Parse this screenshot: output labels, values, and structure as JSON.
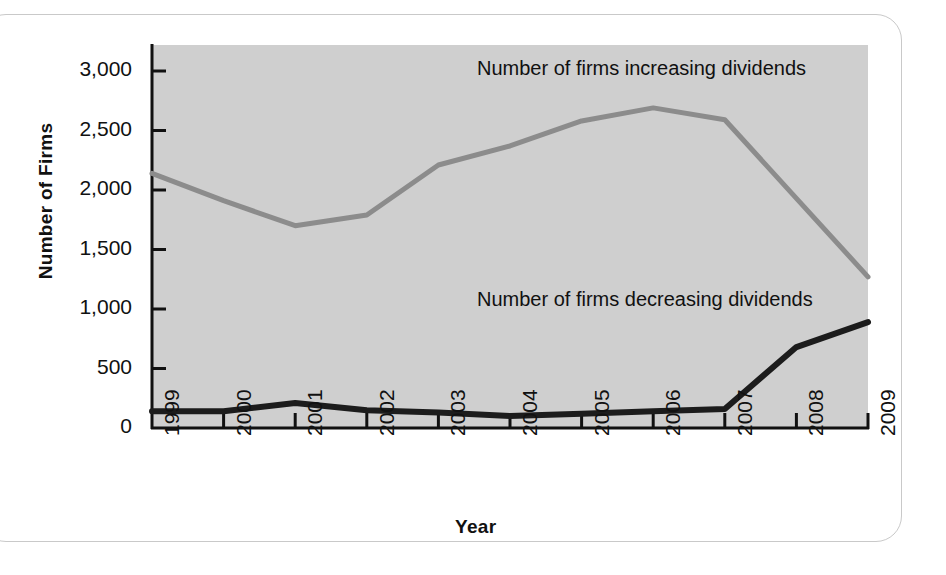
{
  "figure": {
    "background_color": "#ffffff",
    "frame_color": "#c9c9c9",
    "plot_background_color": "#cfcfcf",
    "axis_color": "#111111"
  },
  "chart_data": {
    "type": "line",
    "title": "",
    "xlabel": "Year",
    "ylabel": "Number of Firms",
    "categories": [
      "1999",
      "2000",
      "2001",
      "2002",
      "2003",
      "2004",
      "2005",
      "2006",
      "2007",
      "2008",
      "2009"
    ],
    "x": [
      1999,
      2000,
      2001,
      2002,
      2003,
      2004,
      2005,
      2006,
      2007,
      2008,
      2009
    ],
    "xlim": [
      1999,
      2009
    ],
    "ylim": [
      0,
      3000
    ],
    "yticks": [
      0,
      500,
      1000,
      1500,
      2000,
      2500,
      3000
    ],
    "ytick_labels": [
      "0",
      "500",
      "1,000",
      "1,500",
      "2,000",
      "2,500",
      "3,000"
    ],
    "grid": false,
    "legend_position": "inline-annotation",
    "series": [
      {
        "name": "Number of firms increasing dividends",
        "color": "#8c8c8c",
        "values": [
          2140,
          1910,
          1700,
          1790,
          2210,
          2370,
          2580,
          2690,
          2590,
          1930,
          1270
        ]
      },
      {
        "name": "Number of firms decreasing dividends",
        "color": "#1c1c1c",
        "values": [
          140,
          140,
          210,
          150,
          130,
          100,
          120,
          140,
          160,
          680,
          890
        ]
      }
    ],
    "annotations": [
      {
        "text": "Number of firms increasing dividends",
        "x": 2005,
        "y": 2950
      },
      {
        "text": "Number of firms decreasing dividends",
        "x": 2005,
        "y": 1100
      }
    ]
  }
}
